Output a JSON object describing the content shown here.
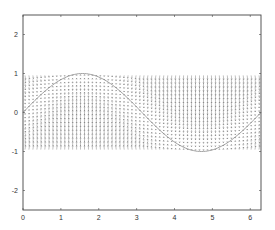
{
  "chart_data": {
    "type": "quiver",
    "title": "",
    "xlabel": "",
    "ylabel": "",
    "xlim": [
      0,
      6.2832
    ],
    "ylim": [
      -2.5,
      2.5
    ],
    "grid": false,
    "legend": null,
    "x_ticks": [
      0,
      1,
      2,
      3,
      4,
      5,
      6
    ],
    "x_tick_labels": [
      "0",
      "1",
      "2",
      "3",
      "4",
      "5",
      "6"
    ],
    "y_ticks": [
      2,
      1,
      0,
      -1,
      -2
    ],
    "y_tick_labels": [
      "2",
      "1",
      "0",
      "-1",
      "-2"
    ],
    "series": [
      {
        "name": "vector-field",
        "kind": "quiver",
        "x_range": [
          0,
          6.2832
        ],
        "y_range": [
          -1,
          1
        ],
        "nx": 60,
        "ny": 20,
        "color": "#555555",
        "description": "Mostly vertical arrows in the band y in [-1,1]; magnitude strongest near y=0 band and where the curve dips, weaker near curve"
      },
      {
        "name": "sine-curve",
        "kind": "line",
        "function": "sin(x)",
        "x_range": [
          0,
          6.2832
        ],
        "color": "#888888"
      }
    ]
  },
  "colors": {
    "axes": "#444444",
    "arrow": "#555555",
    "curve": "#8a8a8a",
    "background": "#ffffff"
  }
}
